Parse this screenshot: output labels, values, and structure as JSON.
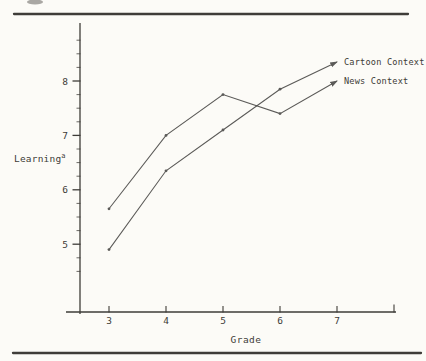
{
  "chart_data": {
    "type": "line",
    "title": "",
    "xlabel": "Grade",
    "ylabel": "Learning",
    "ylabel_superscript": "a",
    "x": [
      3,
      4,
      5,
      6,
      7
    ],
    "x_tick_labels": [
      "3",
      "4",
      "5",
      "6",
      "7"
    ],
    "y_ticks_major": [
      5,
      6,
      7,
      8
    ],
    "y_minor_tick_step": 0.25,
    "y_minor_tick_range": [
      4.5,
      8.75
    ],
    "x_unlabeled_end_tick_at": 8,
    "series": [
      {
        "name": "Cartoon Context",
        "values": [
          4.9,
          6.35,
          7.1,
          7.85,
          8.35
        ],
        "end_marker": "arrow"
      },
      {
        "name": "News Context",
        "values": [
          5.65,
          7.0,
          7.75,
          7.4,
          8.0
        ],
        "end_marker": "arrow"
      }
    ],
    "grid": false,
    "legend_position": "right of line ends"
  },
  "colors": {
    "background": "#fcfbf7",
    "ink": "#3e3c38",
    "line": "#4a4947",
    "rule": "#2f2d29"
  }
}
